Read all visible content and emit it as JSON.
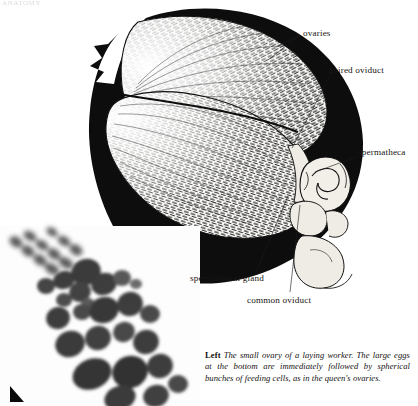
{
  "page": {
    "header_remnant": "ANATOMY",
    "background": "#ffffff",
    "ink": "#15120f"
  },
  "figure_main": {
    "name": "queen-bee-abdomen-ovaries-illustration",
    "kind": "pen-and-ink anatomical illustration",
    "subject": "dissected abdomen of a queen honey bee showing paired ovaries filling the abdomen, with spermatheca, spermathecal gland, paired oviduct and common oviduct at the posterior end",
    "palette": {
      "silhouette": "#0d0d0d",
      "ovary_fill": "#fbfaf7",
      "hatching": "#1c1c1c",
      "organ_fill": "#efece5",
      "organ_outline": "#111111"
    },
    "labels": [
      {
        "id": "ovaries",
        "text": "ovaries",
        "leaders": 2
      },
      {
        "id": "paired-oviduct",
        "text": "paired oviduct",
        "leaders": 1
      },
      {
        "id": "spermatheca",
        "text": "spermatheca",
        "leaders": 1
      },
      {
        "id": "spermathecal-gland",
        "text": "spermathecal gland",
        "leaders": 1
      },
      {
        "id": "common-oviduct",
        "text": "common oviduct",
        "leaders": 1
      }
    ]
  },
  "figure_inset": {
    "name": "ovariole-micrograph",
    "kind": "grayscale photomicrograph",
    "subject": "the small ovary of a laying worker: a diagonal strand of ovarioles bearing dark oocytes that increase in size toward the lower right, interspersed with spherical bunches of feeding (nurse) cells",
    "palette": {
      "background": "#fdfdfd",
      "oocyte_dark": "#3a3a3a",
      "oocyte_mid": "#565656",
      "oocyte_light": "#6e6e6e",
      "marker": "#0a0a0a"
    },
    "marker": "corner-arrow-marker"
  },
  "caption": {
    "lead": "Left",
    "text": "The small ovary of a laying worker. The large eggs at the bottom are immediately followed by spherical bunches of feeding cells, as in the queen's ovaries."
  }
}
